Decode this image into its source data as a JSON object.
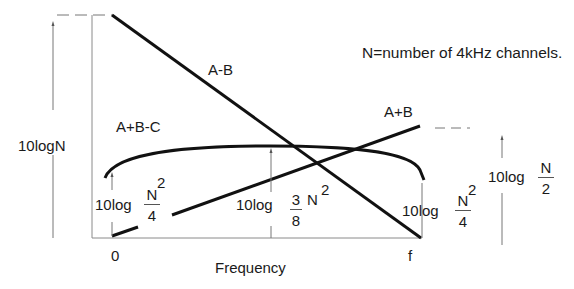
{
  "diagram": {
    "note": "N=number of 4kHz channels.",
    "x_axis": {
      "label": "Frequency",
      "start_tick": "0",
      "end_tick": "f"
    },
    "y_axis": {
      "level_label": "10logN"
    },
    "curves": [
      {
        "name": "A-B",
        "label": "A-B",
        "description": "straight line falling from 10logN at 0 to zero at f"
      },
      {
        "name": "A+B",
        "label": "A+B",
        "description": "straight line rising from zero at 0 to 10log(N/2) at f"
      },
      {
        "name": "A+B-C",
        "label": "A+B-C",
        "description": "arc-shaped curve, 10log(N^2/4) at both ends, peak 10log(3N^2/8) at middle"
      }
    ],
    "annotations": {
      "left_end": {
        "prefix": "10log",
        "num": "N",
        "den": "4",
        "exp": "2"
      },
      "middle": {
        "prefix": "10log",
        "num": "3",
        "den": "8",
        "after": "N",
        "exp": "2"
      },
      "right_end": {
        "prefix": "10log",
        "num": "N",
        "den": "4",
        "exp": "2"
      },
      "right_side": {
        "prefix": "10log",
        "num": "N",
        "den": "2"
      }
    },
    "colors": {
      "curve": "#111111",
      "axis": "#777777",
      "text": "#1a1a1a"
    }
  }
}
